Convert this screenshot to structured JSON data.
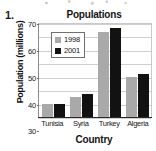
{
  "item_number": "1.",
  "chart_data": {
    "type": "bar",
    "title": "Populations",
    "xlabel": "Country",
    "ylabel": "Population (millions)",
    "categories": [
      "Tunisia",
      "Syria",
      "Turkey",
      "Algeria"
    ],
    "series": [
      {
        "name": "1998",
        "color": "#a9a9a9",
        "values": [
          10,
          15,
          63,
          30
        ]
      },
      {
        "name": "2001",
        "color": "#121212",
        "values": [
          10,
          17,
          66,
          32
        ]
      }
    ],
    "ylim": [
      0,
      70
    ],
    "yticks": [
      0,
      10,
      20,
      30,
      40,
      50,
      60,
      70
    ],
    "ytick_labels": [
      "0",
      "10",
      "20",
      "30",
      "40",
      "50",
      "60",
      "70"
    ],
    "grid": true,
    "legend_position": "upper-left-inside"
  }
}
